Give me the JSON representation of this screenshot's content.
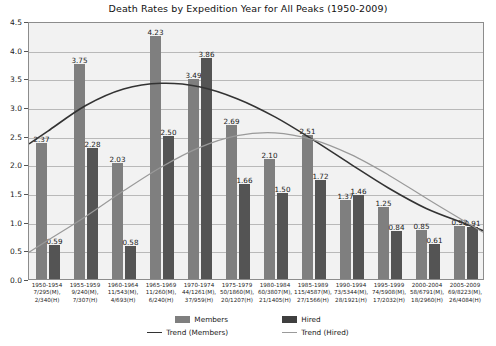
{
  "chart_data": {
    "type": "bar",
    "title": "Death Rates by Expedition Year for All Peaks (1950-2009)",
    "xlabel": "",
    "ylabel": "",
    "ylim": [
      0.0,
      4.5
    ],
    "ytick_step": 0.5,
    "grid": true,
    "legend_position": "bottom",
    "categories": [
      "1950-1954",
      "1955-1959",
      "1960-1964",
      "1965-1969",
      "1970-1974",
      "1975-1979",
      "1980-1984",
      "1985-1989",
      "1990-1994",
      "1995-1999",
      "2000-2004",
      "2005-2009"
    ],
    "category_details": [
      "7/295(M),\n2/340(H)",
      "9/240(M),\n7/307(H)",
      "11/543(M),\n4/693(H)",
      "11/260(M),\n6/240(H)",
      "44/1261(M),\n37/959(H)",
      "50/1860(M),\n20/1207(H)",
      "60/3807(M),\n21/1405(H)",
      "115/4587(M),\n27/1566(H)",
      "73/5344(M),\n28/1921(H)",
      "74/5908(M),\n17/2032(H)",
      "58/6791(M),\n18/2960(H)",
      "69/8223(M),\n26/4084(H)"
    ],
    "ytick_labels": [
      "0.0",
      "0.5",
      "1.0",
      "1.5",
      "2.0",
      "2.5",
      "3.0",
      "3.5",
      "4.0",
      "4.5"
    ],
    "series": [
      {
        "name": "Members",
        "color": "#7f7f7f",
        "values": [
          2.37,
          3.75,
          2.03,
          4.23,
          3.49,
          2.69,
          2.1,
          2.51,
          1.37,
          1.25,
          0.85,
          0.92
        ]
      },
      {
        "name": "Hired",
        "color": "#545454",
        "values": [
          0.59,
          2.28,
          0.58,
          2.5,
          3.86,
          1.66,
          1.5,
          1.72,
          1.46,
          0.84,
          0.61,
          0.91
        ]
      }
    ],
    "trends": [
      {
        "name": "Trend (Members)",
        "color": "#333333",
        "values": [
          2.6,
          3.05,
          3.34,
          3.44,
          3.38,
          3.17,
          2.85,
          2.45,
          2.02,
          1.6,
          1.24,
          0.98
        ]
      },
      {
        "name": "Trend (Hired)",
        "color": "#9a9a9a",
        "values": [
          0.68,
          1.1,
          1.55,
          1.97,
          2.31,
          2.52,
          2.57,
          2.45,
          2.19,
          1.83,
          1.42,
          1.02
        ]
      }
    ]
  },
  "legend": {
    "members_label": "Members",
    "hired_label": "Hired",
    "trend_members_label": "Trend (Members)",
    "trend_hired_label": "Trend (Hired)"
  }
}
